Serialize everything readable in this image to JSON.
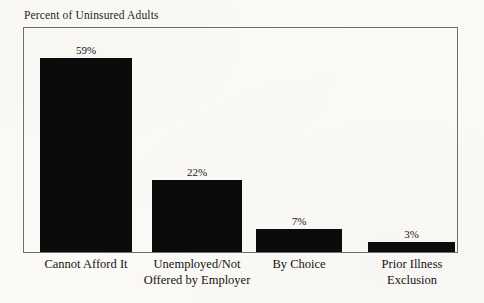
{
  "chart_data": {
    "type": "bar",
    "title": "Percent of Uninsured Adults",
    "xlabel": "",
    "ylabel": "",
    "ylim": [
      0,
      68
    ],
    "grid": false,
    "legend": false,
    "categories": [
      "Cannot Afford It",
      "Unemployed/Not Offered by Employer",
      "By Choice",
      "Prior Illness Exclusion"
    ],
    "category_lines": [
      [
        "Cannot Afford It"
      ],
      [
        "Unemployed/Not",
        "Offered by Employer"
      ],
      [
        "By Choice"
      ],
      [
        "Prior Illness",
        "Exclusion"
      ]
    ],
    "values": [
      59,
      22,
      7,
      3
    ],
    "value_labels": [
      "59%",
      "22%",
      "7%",
      "3%"
    ],
    "bar_color": "#0b0b0b",
    "frame_color": "#6f6f6f",
    "background_color": "#fbfaf7",
    "text_color": "#171717"
  }
}
